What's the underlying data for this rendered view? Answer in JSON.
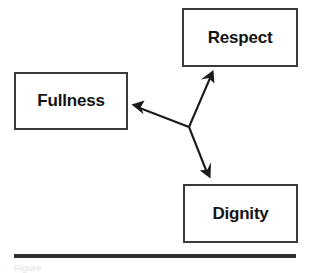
{
  "figure": {
    "type": "relationship-diagram",
    "nodes": [
      {
        "id": "respect",
        "label": "Respect",
        "position": "top-right"
      },
      {
        "id": "fullness",
        "label": "Fullness",
        "position": "left"
      },
      {
        "id": "dignity",
        "label": "Dignity",
        "position": "bottom-right"
      }
    ],
    "hub": {
      "x": 189,
      "y": 127
    },
    "arrows": [
      {
        "id": "hub-to-respect",
        "from": "hub",
        "to": "respect",
        "direction": "up-right",
        "head": "to"
      },
      {
        "id": "hub-to-fullness",
        "from": "hub",
        "to": "fullness",
        "direction": "left",
        "head": "to"
      },
      {
        "id": "hub-to-dignity",
        "from": "hub",
        "to": "dignity",
        "direction": "down-right",
        "head": "to"
      }
    ],
    "rule": {
      "present": true
    },
    "caption": "Figure"
  },
  "colors": {
    "box_border": "#3a3a3a",
    "text": "#141414",
    "arrow": "#1b1b1b",
    "rule": "#2e2e2e",
    "background": "#ffffff"
  }
}
